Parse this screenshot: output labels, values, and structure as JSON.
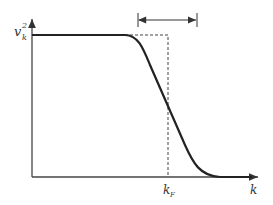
{
  "diagram": {
    "y_axis_label": "v",
    "y_axis_sup": "2",
    "y_axis_sub": "k",
    "x_axis_label": "k",
    "fermi_label": "k",
    "fermi_sub": "F",
    "colors": {
      "curve": "#222222",
      "axis": "#444444",
      "dashed": "#444444"
    }
  }
}
